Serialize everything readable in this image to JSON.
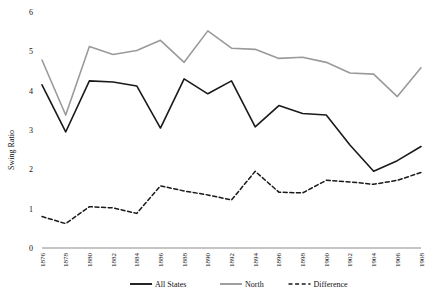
{
  "chart_data": {
    "type": "line",
    "title": "",
    "xlabel": "",
    "ylabel": "Swing Ratio",
    "ylim": [
      0,
      6
    ],
    "yticks": [
      "0",
      "1",
      "2",
      "3",
      "4",
      "5",
      "6"
    ],
    "grid": false,
    "legend_position": "bottom",
    "categories": [
      "1876",
      "1878",
      "1880",
      "1882",
      "1884",
      "1886",
      "1888",
      "1890",
      "1892",
      "1894",
      "1896",
      "1898",
      "1900",
      "1902",
      "1904",
      "1906",
      "1908"
    ],
    "x": [
      1876,
      1878,
      1880,
      1882,
      1884,
      1886,
      1888,
      1890,
      1892,
      1894,
      1896,
      1898,
      1900,
      1902,
      1904,
      1906,
      1908
    ],
    "series": [
      {
        "name": "All States",
        "color": "#1a1a1a",
        "style": "solid",
        "values": [
          4.15,
          2.95,
          4.25,
          4.22,
          4.12,
          3.05,
          4.3,
          3.92,
          4.25,
          3.08,
          3.62,
          3.42,
          3.38,
          2.62,
          1.95,
          2.22,
          2.58
        ]
      },
      {
        "name": "North",
        "color": "#9a9a9a",
        "style": "solid",
        "values": [
          4.78,
          3.38,
          5.12,
          4.92,
          5.02,
          5.28,
          4.72,
          5.52,
          5.08,
          5.05,
          4.82,
          4.85,
          4.72,
          4.45,
          4.42,
          3.85,
          4.58
        ]
      },
      {
        "name": "Difference",
        "color": "#1a1a1a",
        "style": "dashed",
        "values": [
          0.8,
          0.62,
          1.05,
          1.02,
          0.88,
          1.58,
          1.45,
          1.35,
          1.22,
          1.95,
          1.42,
          1.4,
          1.72,
          1.68,
          1.62,
          1.72,
          1.92
        ]
      }
    ]
  },
  "legend": {
    "items": [
      {
        "label": "All States",
        "swatch": "solid-black-line"
      },
      {
        "label": "North",
        "swatch": "solid-gray-line"
      },
      {
        "label": "Difference",
        "swatch": "dashed-black-line"
      }
    ]
  }
}
